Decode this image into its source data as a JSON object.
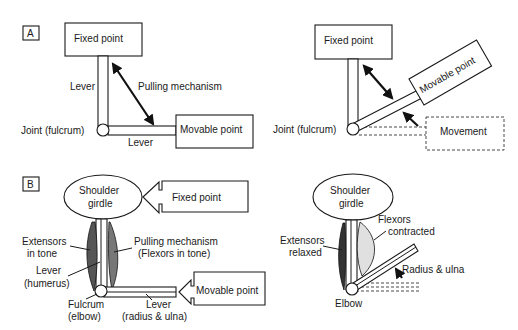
{
  "panels": {
    "A": {
      "tag": "A",
      "left": {
        "fixed_point": "Fixed point",
        "movable_point": "Movable point",
        "lever_vertical": "Lever",
        "lever_horizontal": "Lever",
        "pulling_mechanism": "Pulling mechanism",
        "joint": "Joint (fulcrum)"
      },
      "right": {
        "fixed_point": "Fixed point",
        "movable_point": "Movable point",
        "movement": "Movement",
        "joint": "Joint (fulcrum)"
      }
    },
    "B": {
      "tag": "B",
      "left": {
        "shoulder_line1": "Shoulder",
        "shoulder_line2": "girdle",
        "fixed_point": "Fixed point",
        "movable_point": "Movable point",
        "extensors_line1": "Extensors",
        "extensors_line2": "in tone",
        "pulling_line1": "Pulling mechanism",
        "pulling_line2": "(Flexors in tone)",
        "lever_humerus_line1": "Lever",
        "lever_humerus_line2": "(humerus)",
        "fulcrum_line1": "Fulcrum",
        "fulcrum_line2": "(elbow)",
        "lever_radius_line1": "Lever",
        "lever_radius_line2": "(radius & ulna)"
      },
      "right": {
        "shoulder_line1": "Shoulder",
        "shoulder_line2": "girdle",
        "flexors_line1": "Flexors",
        "flexors_line2": "contracted",
        "extensors_line1": "Extensors",
        "extensors_line2": "relaxed",
        "radius_ulna": "Radius & ulna",
        "elbow": "Elbow"
      }
    }
  },
  "colors": {
    "ink": "#1a1a1a",
    "background": "#ffffff",
    "muscle_fill": "#d8d8d8"
  }
}
